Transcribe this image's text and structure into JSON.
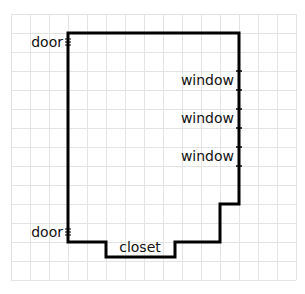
{
  "diagram": {
    "type": "floor-plan",
    "grid": {
      "origin_x": 11,
      "origin_y": 14,
      "cell": 19,
      "cols": 15,
      "rows": 14,
      "line_color": "#e3e3e3"
    },
    "wall_color": "#000000",
    "labels": {
      "door_top": "door",
      "door_bottom": "door",
      "window_1": "window",
      "window_2": "window",
      "window_3": "window",
      "closet": "closet"
    },
    "doors": [
      {
        "name": "door-top",
        "x": 68,
        "y": 42
      },
      {
        "name": "door-bottom",
        "x": 68,
        "y": 232
      }
    ],
    "windows": [
      {
        "name": "window-1",
        "x": 239,
        "y1": 71,
        "y2": 90
      },
      {
        "name": "window-2",
        "x": 239,
        "y1": 109,
        "y2": 128
      },
      {
        "name": "window-3",
        "x": 239,
        "y1": 147,
        "y2": 166
      }
    ]
  }
}
